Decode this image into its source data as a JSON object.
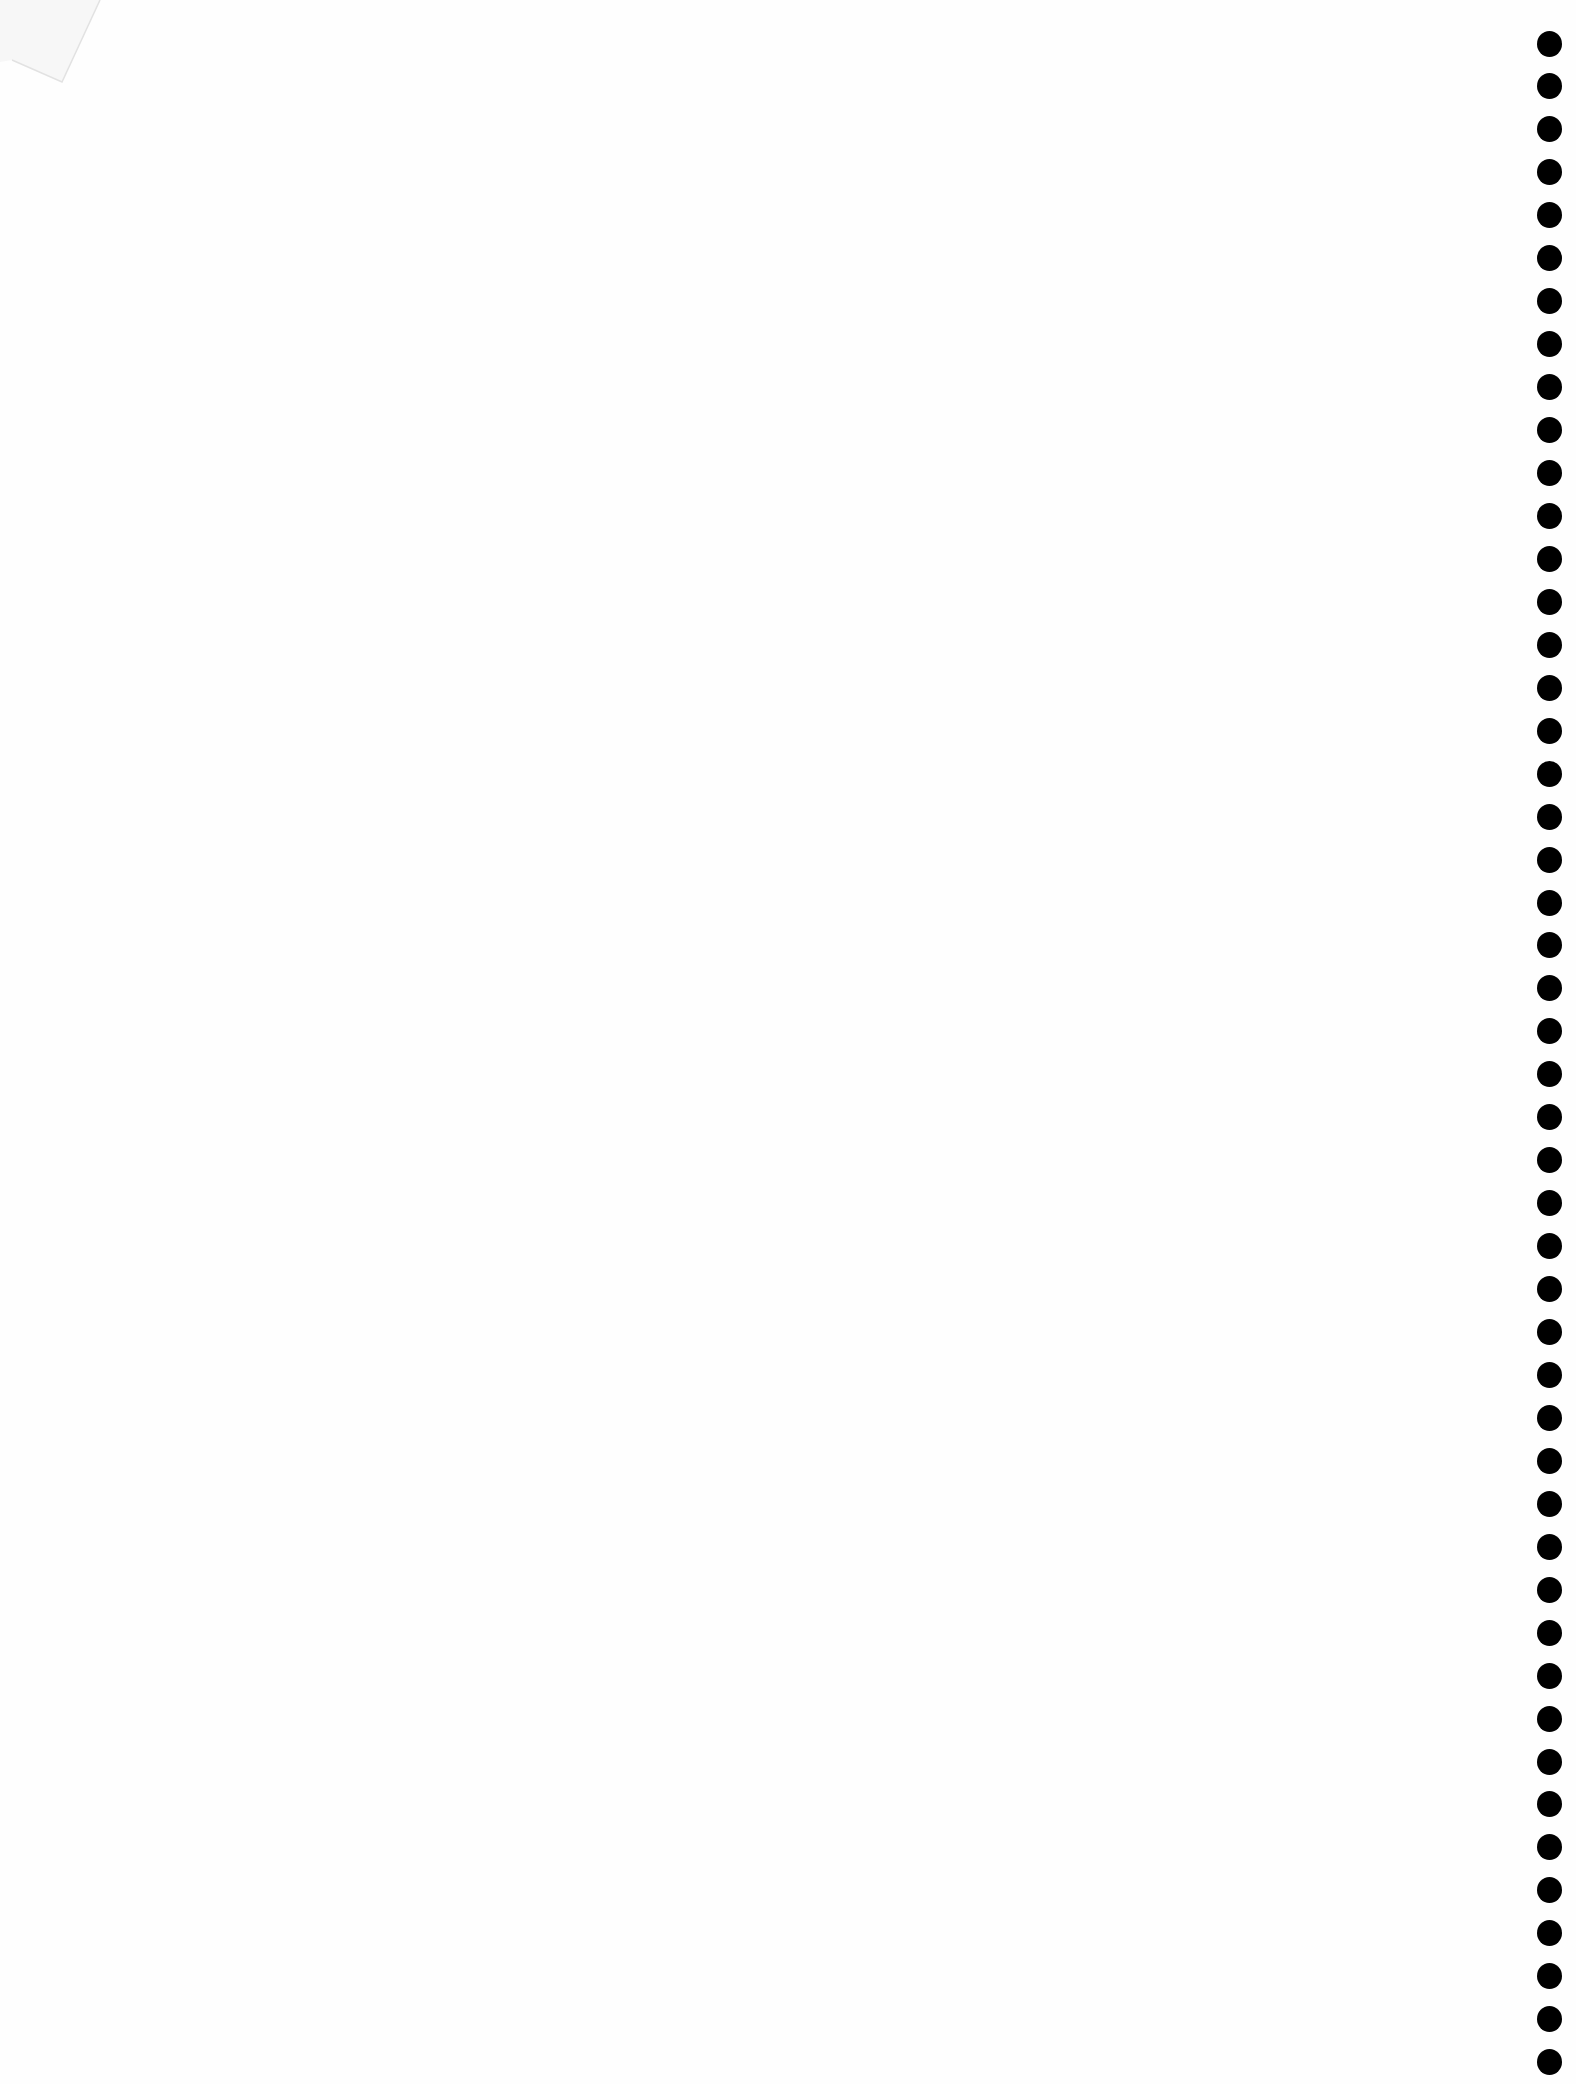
{
  "page": {
    "type": "blank-notebook-page",
    "background_color": "#fefefe",
    "binding": {
      "side": "right",
      "hole_count": 48,
      "hole_color": "#000000",
      "hole_center_x": 1549,
      "first_hole_y": 43,
      "hole_spacing": 42.95,
      "hole_diameter": 25
    },
    "corner_fold": {
      "position": "top-left",
      "visible": true
    }
  }
}
